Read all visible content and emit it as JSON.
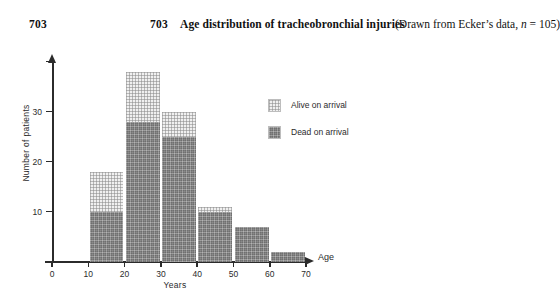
{
  "header": {
    "page_number": "703",
    "figure_number": "703",
    "title": "Age distribution of tracheobronchial injuries",
    "source_prefix": "(Drawn from Ecker’s data, ",
    "source_n_var": "n",
    "source_n_value": " = 105)"
  },
  "chart_data": {
    "type": "bar",
    "stacked": true,
    "title": "Age distribution of tracheobronchial injuries",
    "xlabel": "Years",
    "ylabel": "Number of patients",
    "axis_arrow_label": "Age",
    "categories": [
      "0-10",
      "10-20",
      "20-30",
      "30-40",
      "40-50",
      "50-60",
      "60-70"
    ],
    "bin_starts": [
      0,
      10,
      20,
      30,
      40,
      50,
      60
    ],
    "bin_width": 10,
    "series": [
      {
        "name": "Dead on arrival",
        "color": "#8a8a8a",
        "values": [
          0,
          10,
          28,
          25,
          10,
          7,
          2
        ]
      },
      {
        "name": "Alive on arrival",
        "color": "#f0f0f0",
        "values": [
          0,
          8,
          10,
          5,
          1,
          0,
          0
        ]
      }
    ],
    "totals": [
      0,
      18,
      38,
      30,
      11,
      7,
      2
    ],
    "xlim": [
      0,
      70
    ],
    "ylim": [
      0,
      41
    ],
    "xticks": [
      "0",
      "10",
      "20",
      "30",
      "40",
      "50",
      "60",
      "70"
    ],
    "xtick_values": [
      0,
      10,
      20,
      30,
      40,
      50,
      60,
      70
    ],
    "yticks": [
      "10",
      "20",
      "30"
    ],
    "ytick_values": [
      10,
      20,
      30
    ],
    "ytick_unlabeled_values": [
      40
    ],
    "grid": false,
    "legend_position": "inside-top-right",
    "legend": [
      "Alive on arrival",
      "Dead on arrival"
    ]
  }
}
